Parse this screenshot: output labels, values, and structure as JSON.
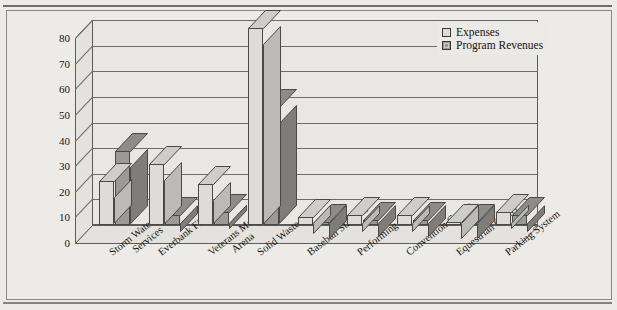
{
  "figure": {
    "background_color": "#edebe7",
    "has_title": false,
    "frame": "thin-black-rectangle"
  },
  "legend": {
    "position": "top-right",
    "entries": [
      {
        "label": "Expenses",
        "color": "#dedcd8",
        "swatch": "expenses-swatch"
      },
      {
        "label": "Program Revenues",
        "color": "#9b9a96",
        "swatch": "program-revenues-swatch"
      }
    ]
  },
  "axis": {
    "y_title": "$ Millions",
    "y_ticks": [
      "80",
      "70",
      "60",
      "50",
      "40",
      "30",
      "20",
      "10",
      "0"
    ]
  },
  "chart_data": {
    "type": "bar",
    "title": "",
    "xlabel": "",
    "ylabel": "$ Millions",
    "ylim": [
      0,
      80
    ],
    "ytick_step": 10,
    "grid": true,
    "three_d": true,
    "legend_position": "top right",
    "categories": [
      "Storm Water Services",
      "Everbank Field",
      "Veterans Memorial Arena",
      "Solid Waste",
      "Baseball Stadium",
      "Performing Arts",
      "Convention Center",
      "Equestrian Center",
      "Parking System"
    ],
    "category_lines": [
      [
        "Storm Water",
        "Services"
      ],
      [
        "Everbank Field"
      ],
      [
        "Veterans Memorial",
        "Arena"
      ],
      [
        "Solid Waste"
      ],
      [
        "Baseball Stadium"
      ],
      [
        "Performing Arts"
      ],
      [
        "Convention Center"
      ],
      [
        "Equestrian Center"
      ],
      [
        "Parking System"
      ]
    ],
    "series": [
      {
        "name": "Expenses",
        "color": "#dedcd8",
        "values": [
          17,
          24,
          16,
          77,
          3,
          4,
          4,
          1,
          5
        ]
      },
      {
        "name": "Program Revenues",
        "color": "#9b9a96",
        "values": [
          29,
          4,
          5,
          46,
          1,
          2,
          2,
          1,
          4
        ]
      }
    ]
  }
}
